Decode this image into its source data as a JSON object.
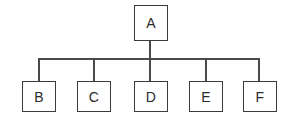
{
  "diagram": {
    "type": "tree-hierarchy",
    "orientation": "top-down",
    "canvas": {
      "width": 293,
      "height": 121,
      "background": "#ffffff"
    },
    "style": {
      "box_border_color": "#3b3b3b",
      "box_fill_color": "#ffffff",
      "edge_color": "#4a4a4a",
      "label_color": "#2b2b2b",
      "line_width_px": 1.6
    },
    "root": {
      "id": "A",
      "label": "A",
      "box": {
        "x": 134,
        "y": 5,
        "width": 34,
        "height": 36
      }
    },
    "children": [
      {
        "id": "B",
        "label": "B",
        "box": {
          "x": 22,
          "y": 81,
          "width": 34,
          "height": 31
        }
      },
      {
        "id": "C",
        "label": "C",
        "box": {
          "x": 77,
          "y": 81,
          "width": 34,
          "height": 31
        }
      },
      {
        "id": "D",
        "label": "D",
        "box": {
          "x": 134,
          "y": 81,
          "width": 34,
          "height": 31
        }
      },
      {
        "id": "E",
        "label": "E",
        "box": {
          "x": 189,
          "y": 81,
          "width": 34,
          "height": 31
        }
      },
      {
        "id": "F",
        "label": "F",
        "box": {
          "x": 243,
          "y": 81,
          "width": 34,
          "height": 31
        }
      }
    ],
    "connectors": {
      "bus_y": 59,
      "bus_x_start": 38,
      "bus_x_end": 260,
      "root_stem": {
        "x": 150,
        "y_top": 41,
        "y_bottom": 59
      },
      "child_drops": [
        {
          "to": "B",
          "x": 38,
          "y_top": 59,
          "y_bottom": 81
        },
        {
          "to": "C",
          "x": 94,
          "y_top": 59,
          "y_bottom": 81
        },
        {
          "to": "D",
          "x": 150,
          "y_top": 59,
          "y_bottom": 81
        },
        {
          "to": "E",
          "x": 206,
          "y_top": 59,
          "y_bottom": 81
        },
        {
          "to": "F",
          "x": 260,
          "y_top": 59,
          "y_bottom": 81
        }
      ]
    }
  }
}
